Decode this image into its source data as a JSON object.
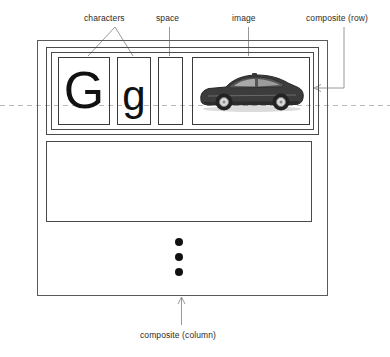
{
  "diagram": {
    "labels": {
      "characters": "characters",
      "space": "space",
      "image": "image",
      "composite_row": "composite (row)",
      "composite_column": "composite (column)"
    },
    "glyphs": {
      "uppercase": "G",
      "lowercase": "g"
    },
    "image_box": {
      "content": "car-photo"
    },
    "ellipsis": {
      "dot_count": 3
    },
    "colors": {
      "stroke": "#4a4a4a",
      "glyph": "#111111",
      "baseline": "#b4b4b4",
      "leader": "#8c8c8c",
      "text": "#2b2b2b"
    }
  }
}
